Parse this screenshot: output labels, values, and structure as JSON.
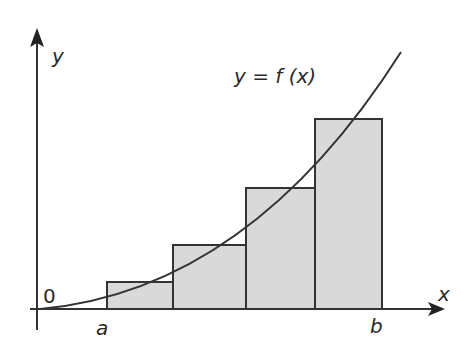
{
  "diagram": {
    "curve_label": "y = f (x)",
    "axes": {
      "x_label": "x",
      "y_label": "y",
      "origin_label": "0"
    },
    "interval": {
      "start_label": "a",
      "end_label": "b"
    },
    "rectangles": [
      {
        "x0": 107,
        "x1": 173,
        "top": 282
      },
      {
        "x0": 173,
        "x1": 246,
        "top": 245
      },
      {
        "x0": 246,
        "x1": 315,
        "top": 188
      },
      {
        "x0": 315,
        "x1": 382,
        "top": 119
      }
    ],
    "colors": {
      "fill": "#d9d9d9",
      "stroke": "#333333",
      "background": "#ffffff"
    }
  }
}
